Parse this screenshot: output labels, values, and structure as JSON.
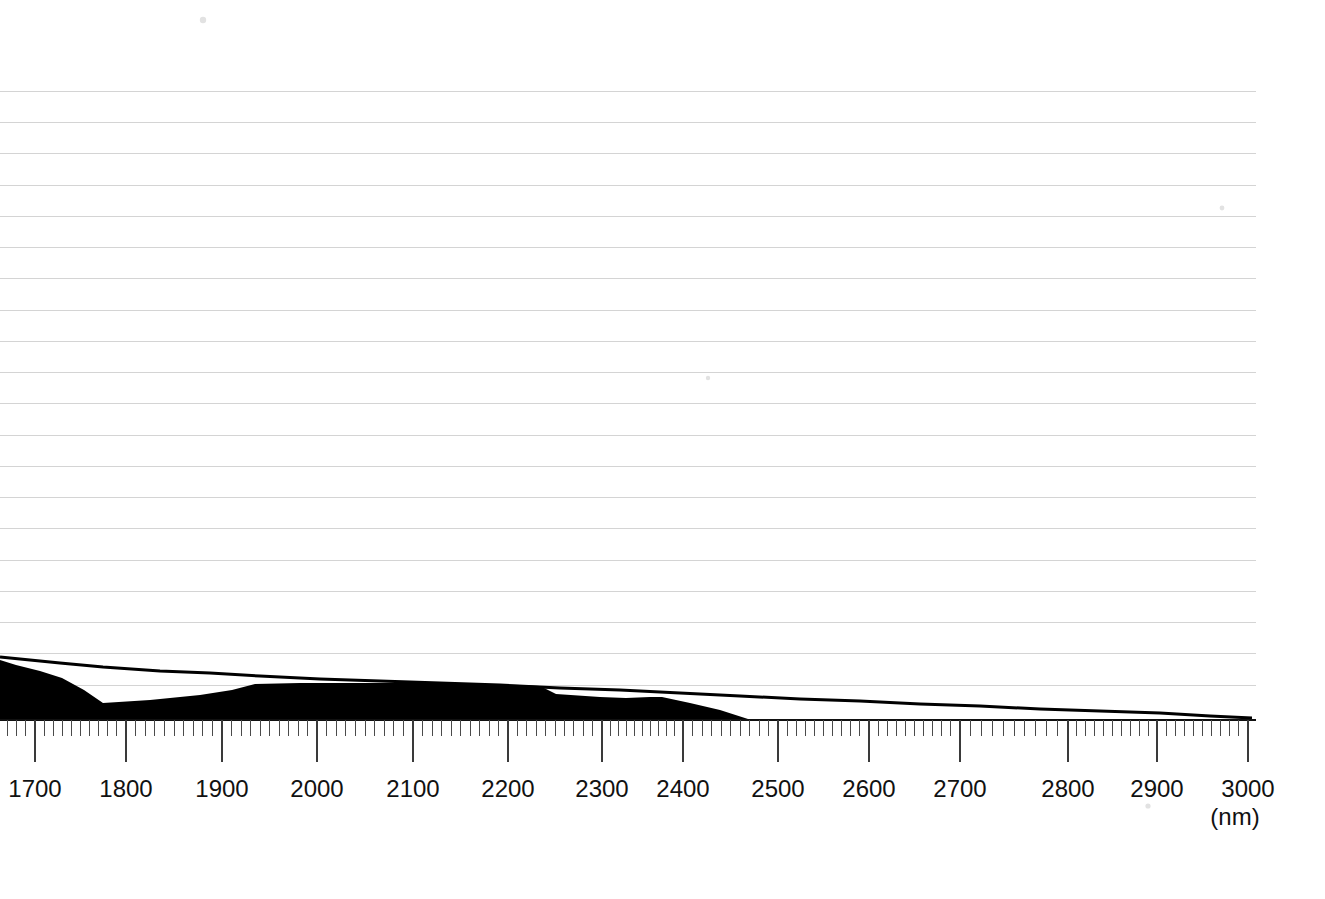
{
  "chart_data": {
    "type": "area",
    "title": "",
    "xlabel": "(nm)",
    "ylabel": "",
    "grid": true,
    "legend_position": "none",
    "x_axis": {
      "unit": "nm",
      "scale": "compressed-nonlinear",
      "tick_labels": [
        "1700",
        "1800",
        "1900",
        "2000",
        "2100",
        "2200",
        "2300",
        "2400",
        "2500",
        "2600",
        "2700",
        "2800",
        "2900",
        "3000"
      ],
      "tick_values": [
        1700,
        1800,
        1900,
        2000,
        2100,
        2200,
        2300,
        2400,
        2500,
        2600,
        2700,
        2800,
        2900,
        3000
      ],
      "tick_pixel_x": [
        35,
        126,
        222,
        317,
        413,
        508,
        602,
        683,
        778,
        869,
        960,
        1068,
        1157,
        1248
      ],
      "minor_ticks_per_major": 10,
      "range": [
        1660,
        3010
      ]
    },
    "y_axis": {
      "gridline_count": 21,
      "gridline_pixel_y": [
        91,
        122,
        153,
        185,
        216,
        247,
        278,
        310,
        341,
        372,
        403,
        435,
        466,
        497,
        528,
        560,
        591,
        622,
        653,
        685
      ],
      "baseline_pixel_y": 720,
      "labels_shown": false,
      "range": [
        0,
        1
      ]
    },
    "series": [
      {
        "name": "upper-envelope-line",
        "style": "line",
        "color": "#000000",
        "points_pixel": [
          [
            0,
            657
          ],
          [
            20,
            659
          ],
          [
            60,
            663
          ],
          [
            103,
            667
          ],
          [
            160,
            671
          ],
          [
            210,
            673
          ],
          [
            260,
            676
          ],
          [
            320,
            679
          ],
          [
            380,
            681
          ],
          [
            440,
            683
          ],
          [
            500,
            685
          ],
          [
            560,
            688
          ],
          [
            620,
            690
          ],
          [
            680,
            693
          ],
          [
            740,
            696
          ],
          [
            800,
            699
          ],
          [
            860,
            701
          ],
          [
            920,
            704
          ],
          [
            980,
            706
          ],
          [
            1040,
            709
          ],
          [
            1100,
            711
          ],
          [
            1160,
            713
          ],
          [
            1210,
            716
          ],
          [
            1252,
            718
          ]
        ],
        "points_data": [
          [
            1660,
            0.098
          ],
          [
            1683,
            0.095
          ],
          [
            1706,
            0.089
          ],
          [
            1730,
            0.084
          ],
          [
            1790,
            0.078
          ],
          [
            1844,
            0.073
          ],
          [
            1900,
            0.069
          ],
          [
            1968,
            0.064
          ],
          [
            2032,
            0.061
          ],
          [
            2096,
            0.058
          ],
          [
            2160,
            0.055
          ],
          [
            2222,
            0.05
          ],
          [
            2284,
            0.047
          ],
          [
            2348,
            0.042
          ],
          [
            2412,
            0.037
          ],
          [
            2478,
            0.033
          ],
          [
            2548,
            0.03
          ],
          [
            2620,
            0.026
          ],
          [
            2700,
            0.022
          ],
          [
            2780,
            0.017
          ],
          [
            2860,
            0.014
          ],
          [
            2930,
            0.011
          ],
          [
            2975,
            0.006
          ],
          [
            3010,
            0.0
          ]
        ]
      },
      {
        "name": "filled-band",
        "style": "area",
        "color": "#000000",
        "points_pixel": [
          [
            0,
            660
          ],
          [
            16,
            665
          ],
          [
            40,
            671
          ],
          [
            62,
            678
          ],
          [
            84,
            690
          ],
          [
            103,
            703
          ],
          [
            150,
            700
          ],
          [
            200,
            695
          ],
          [
            232,
            690
          ],
          [
            255,
            684
          ],
          [
            300,
            683
          ],
          [
            360,
            683
          ],
          [
            420,
            683
          ],
          [
            480,
            684
          ],
          [
            520,
            685
          ],
          [
            540,
            686
          ],
          [
            556,
            694
          ],
          [
            600,
            697
          ],
          [
            626,
            698
          ],
          [
            650,
            697
          ],
          [
            662,
            697
          ],
          [
            690,
            703
          ],
          [
            720,
            710
          ],
          [
            748,
            719
          ]
        ],
        "baseline_pixel_y": 720,
        "points_data": [
          [
            1660,
            0.094
          ],
          [
            1677,
            0.086
          ],
          [
            1702,
            0.078
          ],
          [
            1725,
            0.066
          ],
          [
            1748,
            0.047
          ],
          [
            1768,
            0.027
          ],
          [
            1818,
            0.031
          ],
          [
            1870,
            0.039
          ],
          [
            1904,
            0.047
          ],
          [
            1928,
            0.056
          ],
          [
            1975,
            0.058
          ],
          [
            2038,
            0.058
          ],
          [
            2102,
            0.058
          ],
          [
            2164,
            0.056
          ],
          [
            2206,
            0.055
          ],
          [
            2226,
            0.053
          ],
          [
            2243,
            0.041
          ],
          [
            2289,
            0.036
          ],
          [
            2316,
            0.034
          ],
          [
            2341,
            0.036
          ],
          [
            2354,
            0.036
          ],
          [
            2383,
            0.027
          ],
          [
            2415,
            0.016
          ],
          [
            2460,
            0.0
          ]
        ]
      }
    ]
  },
  "axis": {
    "unit_text": "(nm)"
  }
}
